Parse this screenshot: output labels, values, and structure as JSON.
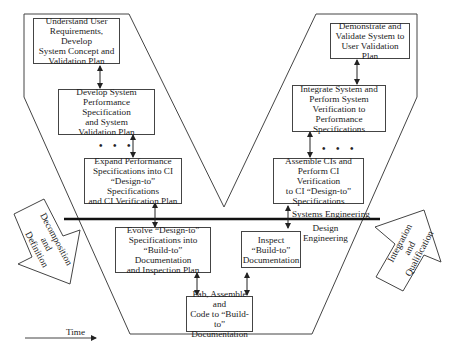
{
  "diagram": {
    "type": "V-model systems engineering process",
    "left_leg": [
      {
        "id": "understand",
        "label": "Understand User\nRequirements, Develop\nSystem Concept and\nValidation Plan"
      },
      {
        "id": "develop",
        "label": "Develop System\nPerformance Specification\nand System\nValidation Plan"
      },
      {
        "id": "expand",
        "label": "Expand Performance\nSpecifications into CI\n“Design-to” Specifications\nand CI Verification  Plan"
      },
      {
        "id": "evolve",
        "label": "Evolve “Design-to”\nSpecifications into\n“Build-to” Documentation\nand Inspection Plan"
      }
    ],
    "bottom": {
      "id": "fab",
      "label": "Fab, Assemble and\nCode to “Build-to”\nDocumentation"
    },
    "right_leg": [
      {
        "id": "inspect",
        "label": "Inspect\n“Build-to”\nDocumentation"
      },
      {
        "id": "assemble",
        "label": "Assemble CIs and\nPerform CI Verification\nto CI “Design-to”\nSpecifications"
      },
      {
        "id": "integrate",
        "label": "Integrate System and\nPerform System\nVerification to\nPerformance Specifications"
      },
      {
        "id": "demonstrate",
        "label": "Demonstrate and\nValidate System to\nUser Validation Plan"
      }
    ],
    "ellipsis": "•  •  •",
    "divider": {
      "upper_label": "Systems Engineering",
      "lower_label": "Design\nEngineering"
    },
    "left_arrow_label": "Decomposition\nand\nDefinition",
    "right_arrow_label": "Integration\nand\nQualification",
    "time_label": "Time"
  }
}
